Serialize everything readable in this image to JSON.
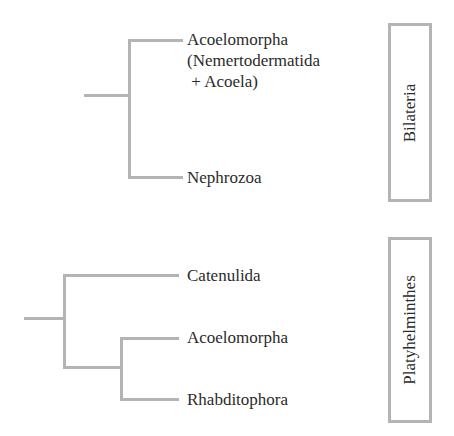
{
  "trees": [
    {
      "name": "bilateria-tree",
      "taxa": [
        {
          "label_lines": [
            "Acoelomorpha",
            "(Nemertodermatida",
            " + Acoela)"
          ]
        },
        {
          "label_lines": [
            "Nephrozoa"
          ]
        }
      ],
      "group_label": "Bilateria"
    },
    {
      "name": "platyhelminthes-tree",
      "taxa": [
        {
          "label_lines": [
            "Catenulida"
          ]
        },
        {
          "label_lines": [
            "Acoelomorpha"
          ]
        },
        {
          "label_lines": [
            "Rhabditophora"
          ]
        }
      ],
      "group_label": "Platyhelminthes"
    }
  ],
  "colors": {
    "branch": "#b4b4b4",
    "text": "#2b2b2b",
    "background": "#ffffff"
  }
}
